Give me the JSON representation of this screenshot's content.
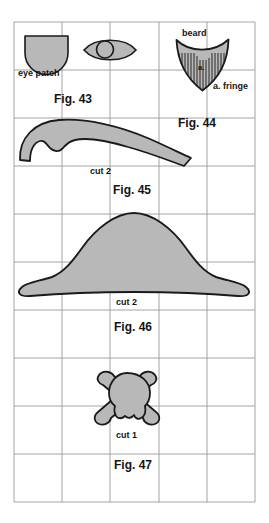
{
  "sheet": {
    "width": 269,
    "height": 523,
    "background": "#ffffff",
    "grid": {
      "color": "#9a9a9a",
      "left": 14,
      "top": 22,
      "right": 255,
      "bottom": 502,
      "cell_w": 48.2,
      "cell_h": 48,
      "cols": 5,
      "rows": 10
    },
    "shape_style": {
      "fill": "#b8b8b8",
      "stroke": "#1a1a1a",
      "stroke_width": 1.6
    }
  },
  "labels": {
    "eye_patch": "eye patch",
    "beard": "beard",
    "a_mark": "a.",
    "a_fringe": "a. fringe",
    "fig43": "Fig. 43",
    "fig44": "Fig. 44",
    "cut2_moustache": "cut 2",
    "fig45": "Fig. 45",
    "cut2_hat": "cut 2",
    "fig46": "Fig. 46",
    "cut1_skull": "cut 1",
    "fig47": "Fig. 47"
  },
  "figures": [
    {
      "id": "eye-patch",
      "name": "eye-patch-shape",
      "figure": "Fig. 43",
      "cut": null,
      "description": "rounded-bottom eye patch"
    },
    {
      "id": "eye",
      "name": "eye-shape",
      "figure": "Fig. 43",
      "cut": null,
      "description": "lens shaped eye with circular pupil"
    },
    {
      "id": "beard",
      "name": "beard-shape",
      "figure": "Fig. 44",
      "cut": null,
      "description": "pointed beard with vertical fringe hatching"
    },
    {
      "id": "moustache",
      "name": "moustache-shape",
      "figure": "Fig. 45",
      "cut": "cut 2",
      "description": "curved sideburn / moustache half"
    },
    {
      "id": "hat",
      "name": "pirate-hat-shape",
      "figure": "Fig. 46",
      "cut": "cut 2",
      "description": "bicorne pirate hat"
    },
    {
      "id": "skull",
      "name": "skull-and-crossbones-shape",
      "figure": "Fig. 47",
      "cut": "cut 1",
      "description": "skull with crossed bones"
    }
  ]
}
